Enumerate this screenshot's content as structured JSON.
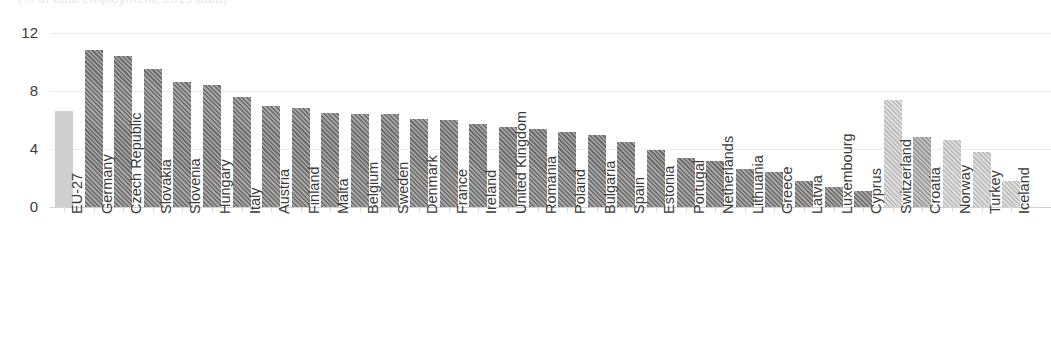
{
  "title_cutoff": "(% of total employment, 2019 data)",
  "chart_data": {
    "type": "bar",
    "title": "(% of total employment, 2019 data)",
    "xlabel": "",
    "ylabel": "",
    "ylim": [
      0,
      12
    ],
    "yticks": [
      0,
      4,
      8,
      12
    ],
    "ytick_labels": [
      "0",
      "4",
      "8",
      "12"
    ],
    "grid": true,
    "legend": "none",
    "orientation": "vertical",
    "categories": [
      "EU-27",
      "Germany",
      "Czech Republic",
      "Slovakia",
      "Slovenia",
      "Hungary",
      "Italy",
      "Austria",
      "Finland",
      "Malta",
      "Belgium",
      "Sweden",
      "Denmark",
      "France",
      "Ireland",
      "United Kingdom",
      "Romania",
      "Poland",
      "Bulgaria",
      "Spain",
      "Estonia",
      "Portugal",
      "Netherlands",
      "Lithuania",
      "Greece",
      "Latvia",
      "Luxembourg",
      "Cyprus",
      "Switzerland",
      "Croatia",
      "Norway",
      "Turkey",
      "Iceland"
    ],
    "values": [
      6.6,
      10.8,
      10.4,
      9.5,
      8.6,
      8.4,
      7.6,
      7.0,
      6.8,
      6.5,
      6.4,
      6.4,
      6.1,
      6.0,
      5.7,
      5.5,
      5.4,
      5.2,
      5.0,
      4.5,
      3.9,
      3.4,
      3.2,
      2.6,
      2.4,
      1.8,
      1.4,
      1.1,
      7.4,
      4.8,
      4.6,
      3.8,
      1.8
    ],
    "styles": [
      "solid",
      "hatch-dark",
      "hatch-dark",
      "hatch-dark",
      "hatch-dark",
      "hatch-dark",
      "hatch-dark",
      "hatch-dark",
      "hatch-dark",
      "hatch-dark",
      "hatch-dark",
      "hatch-dark",
      "hatch-dark",
      "hatch-dark",
      "hatch-dark",
      "hatch-dark",
      "hatch-dark",
      "hatch-dark",
      "hatch-dark",
      "hatch-dark",
      "hatch-dark",
      "hatch-dark",
      "hatch-dark",
      "hatch-dark",
      "hatch-dark",
      "hatch-dark",
      "hatch-dark",
      "hatch-dark",
      "hatch-light",
      "hatch-mid",
      "hatch-light",
      "hatch-light",
      "hatch-light"
    ],
    "colors": {
      "aggregate_bar": "#cfcfcf",
      "eu_member_bar": "#6e6e6e",
      "non_eu_bar": "#bdbdbd",
      "gridline": "#ededed",
      "axis": "#d2d2d2",
      "text": "#3a3a3a"
    }
  }
}
